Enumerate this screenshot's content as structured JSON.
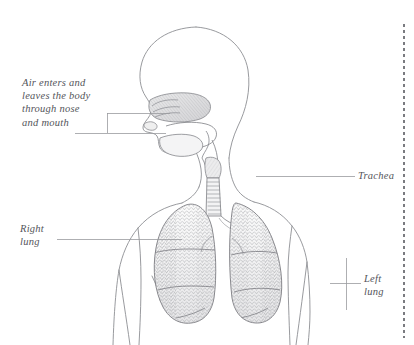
{
  "figure": {
    "title_alt": "Human respiratory system: head, neck, trachea and lungs",
    "ink_color": "#6e6f74",
    "line_color": "#8d8e93",
    "leader_color": "#9a9b9f",
    "label_color": "#54555a",
    "margin_rule_color": "#7a7b80",
    "lung_fill": "#f2f2f3",
    "body_fill": "#ffffff"
  },
  "labels": {
    "airway": "Air enters and\nleaves the body\nthrough nose\nand mouth",
    "trachea": "Trachea",
    "right_lung": "Right\nlung",
    "left_lung": "Left\nlung"
  },
  "leaders": [
    {
      "name": "airway-upper",
      "x1": 107,
      "y1": 113,
      "x2": 170,
      "y2": 113
    },
    {
      "name": "airway-bracket",
      "x1": 107,
      "y1": 113,
      "x2": 107,
      "y2": 133
    },
    {
      "name": "airway-lower",
      "x1": 75,
      "y1": 133,
      "x2": 166,
      "y2": 133
    },
    {
      "name": "trachea",
      "x1": 256,
      "y1": 176,
      "x2": 355,
      "y2": 176
    },
    {
      "name": "right-lung",
      "x1": 57,
      "y1": 239,
      "x2": 182,
      "y2": 239
    },
    {
      "name": "left-lung-horizontal",
      "x1": 330,
      "y1": 283,
      "x2": 361,
      "y2": 283
    },
    {
      "name": "left-lung-vertical",
      "x1": 346,
      "y1": 258,
      "x2": 346,
      "y2": 310
    }
  ],
  "margin_rule": {
    "x": 404,
    "y_start": 24,
    "y_end": 338,
    "dash_length": 3,
    "gap_length": 3
  }
}
